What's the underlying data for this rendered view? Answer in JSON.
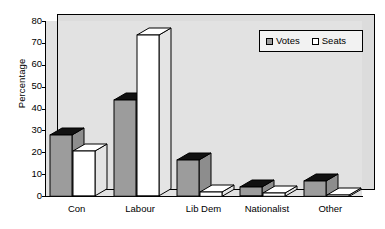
{
  "chart_data": {
    "type": "bar",
    "title": "",
    "xlabel": "",
    "ylabel": "Percentage",
    "ylim": [
      0,
      80
    ],
    "ytick_step": 10,
    "yticks": [
      "0",
      "10",
      "20",
      "30",
      "40",
      "50",
      "60",
      "70",
      "80"
    ],
    "grid": false,
    "legend_position": "top-right",
    "style": "3d-column",
    "categories": [
      "Con",
      "Labour",
      "Lib Dem",
      "Nationalist",
      "Other"
    ],
    "series": [
      {
        "name": "Votes",
        "values": [
          28,
          44,
          16.5,
          4,
          7
        ],
        "color": "#9c9c9c"
      },
      {
        "name": "Seats",
        "values": [
          20.5,
          73.5,
          2,
          1.5,
          0.5
        ],
        "color": "#ffffff"
      }
    ]
  },
  "legend": {
    "items": [
      {
        "label": "Votes",
        "swatch": "votes"
      },
      {
        "label": "Seats",
        "swatch": "seats"
      }
    ]
  },
  "axes": {
    "y_title": "Percentage"
  },
  "colors": {
    "bar_votes": "#9c9c9c",
    "bar_seats": "#ffffff",
    "bar_top": "#111111",
    "plot_background": "#e2e2e2",
    "axis": "#000000"
  }
}
